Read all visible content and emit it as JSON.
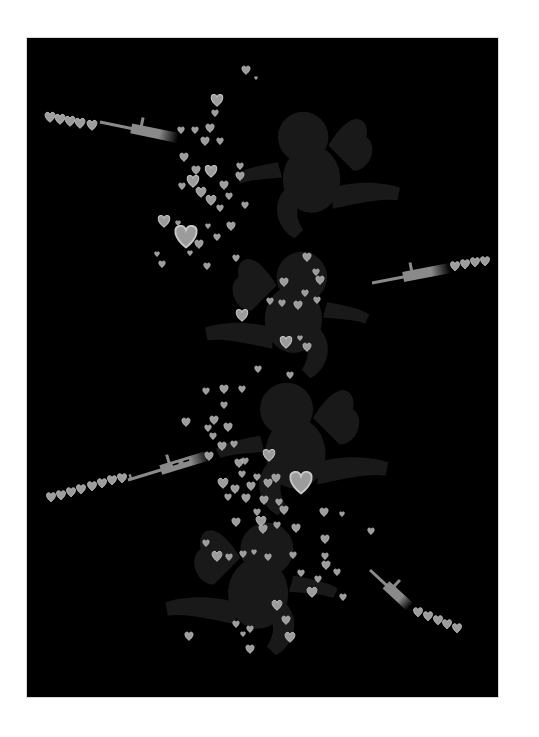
{
  "artwork": {
    "subject": "cupids firing guns that shoot hearts",
    "colors": {
      "page": "#ffffff",
      "panel": "#000000",
      "cupid": "#191919",
      "heart_fill": "#9c9c9c",
      "heart_edge": "#c8c8c8",
      "gun": "#8a8a8a"
    },
    "panel": {
      "x": 27,
      "y": 38,
      "w": 471,
      "h": 659
    }
  },
  "cupids": [
    {
      "name": "cupid-top",
      "x": 235,
      "y": 95,
      "scale": 1.0,
      "flip": false
    },
    {
      "name": "cupid-second",
      "x": 200,
      "y": 235,
      "scale": 1.0,
      "flip": true
    },
    {
      "name": "cupid-third",
      "x": 215,
      "y": 365,
      "scale": 1.05,
      "flip": false
    },
    {
      "name": "cupid-bottom",
      "x": 160,
      "y": 505,
      "scale": 1.05,
      "flip": true
    }
  ],
  "guns": [
    {
      "name": "rifle-top",
      "x1": 100,
      "y1": 122,
      "x2": 178,
      "y2": 138,
      "type": "m16"
    },
    {
      "name": "rifle-second",
      "x1": 372,
      "y1": 283,
      "x2": 450,
      "y2": 268,
      "type": "m16"
    },
    {
      "name": "rifle-third",
      "x1": 128,
      "y1": 480,
      "x2": 210,
      "y2": 455,
      "type": "ak47"
    },
    {
      "name": "rifle-bottom",
      "x1": 370,
      "y1": 570,
      "x2": 410,
      "y2": 607,
      "type": "m16"
    }
  ],
  "heart_streams": [
    {
      "name": "stream-top",
      "hearts": [
        [
          50,
          117,
          6
        ],
        [
          60,
          119,
          6
        ],
        [
          70,
          121,
          6
        ],
        [
          80,
          123,
          6
        ],
        [
          92,
          125,
          6
        ]
      ]
    },
    {
      "name": "stream-second",
      "hearts": [
        [
          455,
          266,
          5.5
        ],
        [
          465,
          264,
          5.5
        ],
        [
          475,
          262,
          5.5
        ],
        [
          485,
          261,
          5.5
        ]
      ]
    },
    {
      "name": "stream-third",
      "hearts": [
        [
          51,
          497,
          5.5
        ],
        [
          61,
          495,
          5.5
        ],
        [
          71,
          492,
          5.5
        ],
        [
          81,
          489,
          5.5
        ],
        [
          92,
          486,
          5.5
        ],
        [
          102,
          483,
          5.5
        ],
        [
          112,
          480,
          5.5
        ],
        [
          122,
          478,
          5.5
        ]
      ]
    },
    {
      "name": "stream-bottom",
      "hearts": [
        [
          418,
          612,
          5.5
        ],
        [
          428,
          616,
          5.5
        ],
        [
          438,
          620,
          5.5
        ],
        [
          447,
          624,
          5.5
        ],
        [
          457,
          628,
          5.5
        ]
      ]
    }
  ],
  "hearts": [
    [
      246,
      70,
      5
    ],
    [
      256,
      78,
      2
    ],
    [
      217,
      100,
      7
    ],
    [
      215,
      113,
      4
    ],
    [
      210,
      128,
      5
    ],
    [
      181,
      130,
      4
    ],
    [
      195,
      130,
      4
    ],
    [
      205,
      141,
      5
    ],
    [
      220,
      141,
      4
    ],
    [
      184,
      157,
      5
    ],
    [
      196,
      170,
      5
    ],
    [
      211,
      171,
      7
    ],
    [
      193,
      181,
      7
    ],
    [
      240,
      176,
      5
    ],
    [
      182,
      186,
      4
    ],
    [
      224,
      185,
      5
    ],
    [
      201,
      192,
      6
    ],
    [
      211,
      200,
      6
    ],
    [
      240,
      166,
      4
    ],
    [
      245,
      205,
      4
    ],
    [
      220,
      208,
      4
    ],
    [
      229,
      196,
      4
    ],
    [
      164,
      221,
      7
    ],
    [
      178,
      223,
      3
    ],
    [
      186,
      236,
      13
    ],
    [
      208,
      226,
      3
    ],
    [
      217,
      237,
      4
    ],
    [
      157,
      254,
      3
    ],
    [
      231,
      226,
      5
    ],
    [
      199,
      244,
      5
    ],
    [
      190,
      253,
      3
    ],
    [
      162,
      264,
      4
    ],
    [
      207,
      266,
      4
    ],
    [
      236,
      258,
      4
    ],
    [
      307,
      257,
      5
    ],
    [
      316,
      272,
      4
    ],
    [
      320,
      280,
      5
    ],
    [
      284,
      282,
      5
    ],
    [
      305,
      293,
      4
    ],
    [
      317,
      300,
      4
    ],
    [
      242,
      315,
      7
    ],
    [
      270,
      301,
      4
    ],
    [
      282,
      303,
      4
    ],
    [
      298,
      305,
      5
    ],
    [
      286,
      342,
      7
    ],
    [
      300,
      338,
      3
    ],
    [
      307,
      347,
      5
    ],
    [
      258,
      369,
      4
    ],
    [
      290,
      375,
      4
    ],
    [
      224,
      389,
      5
    ],
    [
      242,
      389,
      4
    ],
    [
      206,
      391,
      4
    ],
    [
      224,
      405,
      4
    ],
    [
      186,
      422,
      5
    ],
    [
      208,
      428,
      4
    ],
    [
      214,
      420,
      5
    ],
    [
      228,
      427,
      5
    ],
    [
      213,
      436,
      4
    ],
    [
      222,
      446,
      5
    ],
    [
      234,
      444,
      4
    ],
    [
      209,
      456,
      5
    ],
    [
      239,
      463,
      5
    ],
    [
      245,
      461,
      4
    ],
    [
      269,
      455,
      7
    ],
    [
      242,
      474,
      4
    ],
    [
      257,
      477,
      4
    ],
    [
      251,
      486,
      5
    ],
    [
      268,
      483,
      5
    ],
    [
      276,
      478,
      5
    ],
    [
      301,
      482,
      13
    ],
    [
      279,
      502,
      4
    ],
    [
      223,
      483,
      6
    ],
    [
      235,
      489,
      5
    ],
    [
      228,
      497,
      4
    ],
    [
      246,
      498,
      5
    ],
    [
      264,
      500,
      5
    ],
    [
      257,
      512,
      4
    ],
    [
      261,
      521,
      6
    ],
    [
      263,
      529,
      5
    ],
    [
      284,
      510,
      5
    ],
    [
      236,
      522,
      5
    ],
    [
      324,
      512,
      5
    ],
    [
      342,
      514,
      3
    ],
    [
      243,
      554,
      4
    ],
    [
      254,
      552,
      3
    ],
    [
      268,
      557,
      4
    ],
    [
      293,
      555,
      4
    ],
    [
      206,
      543,
      4
    ],
    [
      229,
      557,
      4
    ],
    [
      217,
      556,
      6
    ],
    [
      296,
      528,
      5
    ],
    [
      277,
      525,
      4
    ],
    [
      325,
      539,
      5
    ],
    [
      325,
      556,
      4
    ],
    [
      326,
      565,
      5
    ],
    [
      301,
      573,
      4
    ],
    [
      318,
      579,
      4
    ],
    [
      337,
      572,
      4
    ],
    [
      312,
      592,
      6
    ],
    [
      343,
      597,
      4
    ],
    [
      277,
      605,
      6
    ],
    [
      286,
      620,
      5
    ],
    [
      236,
      624,
      4
    ],
    [
      290,
      637,
      6
    ],
    [
      250,
      629,
      4
    ],
    [
      250,
      649,
      5
    ],
    [
      243,
      634,
      3
    ],
    [
      189,
      636,
      5
    ],
    [
      371,
      531,
      4
    ]
  ]
}
